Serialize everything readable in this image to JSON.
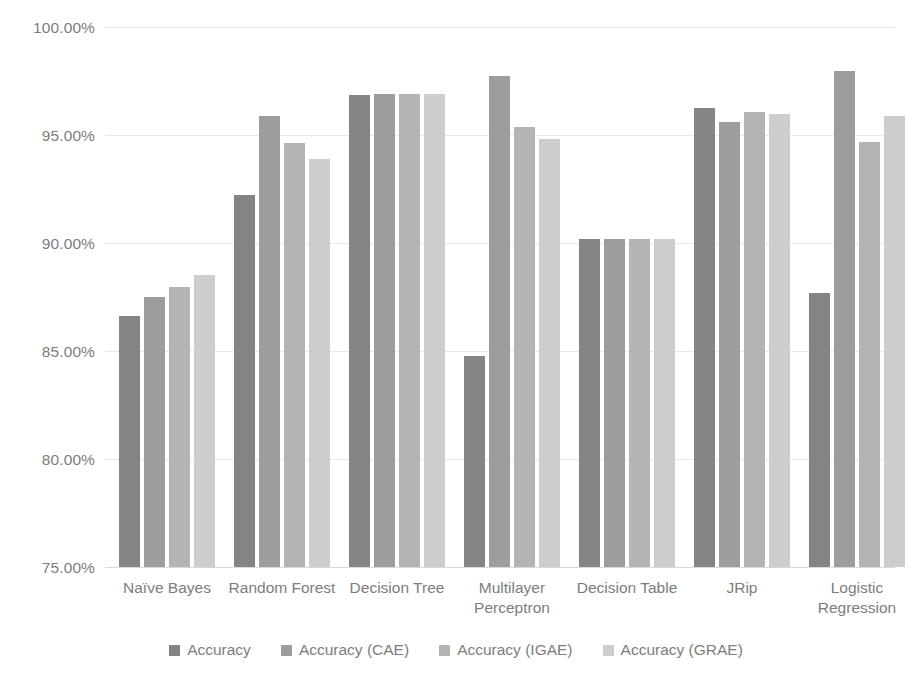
{
  "chart_data": {
    "type": "bar",
    "title": "",
    "xlabel": "",
    "ylabel": "",
    "ylim": [
      75,
      100
    ],
    "ytick_labels": [
      "100.00%",
      "95.00%",
      "90.00%",
      "85.00%",
      "80.00%",
      "75.00%"
    ],
    "ytick_values": [
      100,
      95,
      90,
      85,
      80,
      75
    ],
    "grid": true,
    "legend_position": "bottom",
    "categories": [
      "Naïve Bayes",
      "Random Forest",
      "Decision Tree",
      "Multilayer Perceptron",
      "Decision Table",
      "JRip",
      "Logistic Regression"
    ],
    "series": [
      {
        "name": "Accuracy",
        "color": "#848484",
        "values": [
          86.6,
          92.22,
          96.85,
          84.77,
          90.19,
          96.25,
          87.69
        ]
      },
      {
        "name": "Accuracy (CAE)",
        "color": "#9d9d9d",
        "values": [
          87.52,
          95.88,
          96.9,
          97.73,
          90.19,
          95.6,
          97.96
        ]
      },
      {
        "name": "Accuracy (IGAE)",
        "color": "#b4b4b4",
        "values": [
          87.98,
          94.63,
          96.9,
          95.37,
          90.19,
          96.06,
          94.68
        ]
      },
      {
        "name": "Accuracy (GRAE)",
        "color": "#cdcdcd",
        "values": [
          88.54,
          93.89,
          96.9,
          94.81,
          90.19,
          95.97,
          95.88
        ]
      }
    ]
  }
}
